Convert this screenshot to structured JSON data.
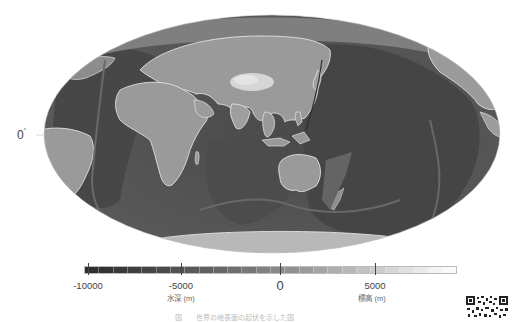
{
  "map": {
    "projection": "Mollweide (equal-area, Asia/Pacific-centered)",
    "equator_label": "0",
    "equator_label_unit": "°",
    "ellipse": {
      "cx": 272,
      "cy": 134,
      "rx": 228,
      "ry": 119
    },
    "colors": {
      "deep_ocean": "#3c3c3c",
      "ocean": "#575757",
      "shelf": "#8a8a8a",
      "land": "#9a9a9a",
      "high_land": "#d2d2d2",
      "coastline": "#f0f0f0"
    }
  },
  "legend": {
    "ticks": [
      {
        "value": "-10000",
        "x": 88,
        "big": false
      },
      {
        "value": "-5000",
        "x": 181,
        "big": false
      },
      {
        "value": "0",
        "x": 280,
        "big": true
      },
      {
        "value": "5000",
        "x": 375,
        "big": false
      }
    ],
    "depth_label": "水深 (m)",
    "depth_label_x": 181,
    "elevation_label": "標高 (m)",
    "elevation_label_x": 372,
    "segments": [
      "#2e2e2e",
      "#333333",
      "#393939",
      "#3f3f3f",
      "#454545",
      "#4b4b4b",
      "#525252",
      "#595959",
      "#606060",
      "#676767",
      "#6f6f6f",
      "#777777",
      "#808080",
      "#888888",
      "#919191",
      "#9a9a9a",
      "#a4a4a4",
      "#aeaeae",
      "#b8b8b8",
      "#c2c2c2",
      "#cccccc",
      "#d6d6d6",
      "#e0e0e0",
      "#eaeaea",
      "#f3f3f3",
      "#fafafa"
    ]
  },
  "caption": "図　　世界の地表面の起伏を示した図"
}
